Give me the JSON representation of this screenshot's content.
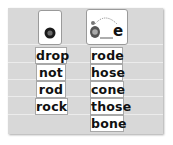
{
  "columns": [
    {
      "icon": "short-o-ball-icon",
      "words": [
        "drop",
        "not",
        "rod",
        "rock"
      ]
    },
    {
      "icon": "long-o-tortoise-silent-e-icon",
      "icon_letter": "e",
      "words": [
        "rode",
        "hose",
        "cone",
        "those",
        "bone"
      ]
    }
  ],
  "colors": {
    "panel": "#d8d8d8",
    "card": "#ffffff",
    "text": "#111111"
  }
}
